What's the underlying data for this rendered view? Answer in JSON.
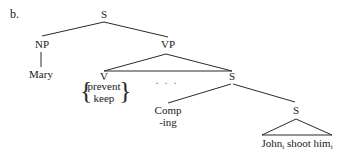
{
  "example_label": "b.",
  "tree": {
    "root": "S",
    "subject": {
      "category": "NP",
      "word": "Mary"
    },
    "predicate": {
      "category": "VP",
      "verb": {
        "category": "V",
        "alternatives": [
          "prevent",
          "keep"
        ]
      },
      "ellipsis": ". . .",
      "complement": {
        "category": "S",
        "comp": {
          "category": "Comp",
          "word": "-ing"
        },
        "embedded": {
          "category": "S",
          "words": [
            {
              "text": "John",
              "subscript": "i"
            },
            {
              "text": " shoot "
            },
            {
              "text": "him",
              "subscript": "i"
            }
          ]
        }
      }
    }
  }
}
